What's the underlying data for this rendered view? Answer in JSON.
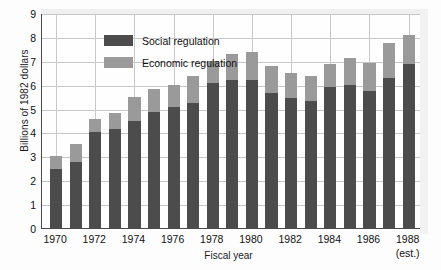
{
  "chart_data": {
    "type": "bar",
    "stacked": true,
    "title": "",
    "xlabel": "Fiscal year",
    "ylabel": "Billions of 1982 dollars",
    "ylim": [
      0,
      9
    ],
    "yticks": [
      0,
      1,
      2,
      3,
      4,
      5,
      6,
      7,
      8,
      9
    ],
    "grid": true,
    "legend_position": "top-left-inside",
    "categories": [
      "1970",
      "1971",
      "1972",
      "1973",
      "1974",
      "1975",
      "1976",
      "1977",
      "1978",
      "1979",
      "1980",
      "1981",
      "1982",
      "1983",
      "1984",
      "1985",
      "1986",
      "1987",
      "1988"
    ],
    "visible_tick_labels": [
      "1970",
      "1972",
      "1974",
      "1976",
      "1978",
      "1980",
      "1982",
      "1984",
      "1986",
      "1988"
    ],
    "last_category_note": "(est.)",
    "series": [
      {
        "name": "Social regulation",
        "color": "#4c4c4c",
        "values": [
          2.45,
          2.75,
          4.0,
          4.15,
          4.5,
          4.85,
          5.05,
          5.25,
          6.05,
          6.2,
          6.2,
          5.65,
          5.45,
          5.3,
          5.9,
          6.0,
          5.75,
          6.3,
          6.85
        ]
      },
      {
        "name": "Economic regulation",
        "color": "#9a9a9a",
        "values": [
          0.55,
          0.75,
          0.55,
          0.65,
          1.0,
          0.95,
          0.95,
          1.1,
          0.95,
          1.1,
          1.15,
          1.15,
          1.05,
          1.05,
          0.95,
          1.1,
          1.15,
          1.45,
          1.25
        ]
      }
    ],
    "totals": [
      3.0,
      3.5,
      4.55,
      4.8,
      5.5,
      5.8,
      6.0,
      6.35,
      7.0,
      7.3,
      7.35,
      6.8,
      6.5,
      6.35,
      6.85,
      7.1,
      6.9,
      7.75,
      8.1
    ]
  },
  "legend": {
    "items": [
      {
        "label": "Social regulation",
        "color": "#4c4c4c"
      },
      {
        "label": "Economic regulation",
        "color": "#9a9a9a"
      }
    ]
  },
  "axes": {
    "y_title": "Billions of 1982 dollars",
    "x_title": "Fiscal year"
  }
}
